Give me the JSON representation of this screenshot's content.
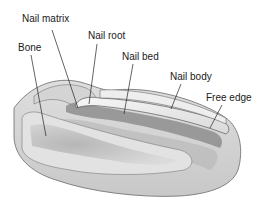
{
  "diagram": {
    "labels": [
      {
        "id": "nail-matrix",
        "text": "Nail matrix",
        "x": 22,
        "y": 13,
        "line": [
          52,
          30,
          78,
          108
        ]
      },
      {
        "id": "nail-root",
        "text": "Nail root",
        "x": 88,
        "y": 30,
        "line": [
          97,
          44,
          89,
          104
        ]
      },
      {
        "id": "bone",
        "text": "Bone",
        "x": 18,
        "y": 42,
        "line": [
          31,
          55,
          46,
          136
        ]
      },
      {
        "id": "nail-bed",
        "text": "Nail bed",
        "x": 122,
        "y": 51,
        "line": [
          133,
          64,
          124,
          114
        ]
      },
      {
        "id": "nail-body",
        "text": "Nail body",
        "x": 170,
        "y": 71,
        "line": [
          181,
          84,
          171,
          109
        ]
      },
      {
        "id": "free-edge",
        "text": "Free edge",
        "x": 206,
        "y": 92,
        "line": [
          222,
          105,
          210,
          128
        ]
      }
    ],
    "colors": {
      "skin_light": "#e6e6e6",
      "skin_mid": "#cfcfcf",
      "skin_dark": "#9c9c9c",
      "outline": "#555555",
      "nail_plate": "#f2f2f2",
      "bone": "#dcdcdc",
      "marrow": "#b0b0b0",
      "leader": "#222222"
    }
  }
}
